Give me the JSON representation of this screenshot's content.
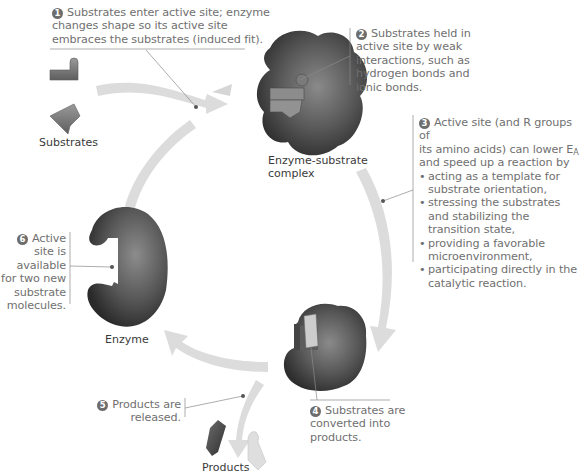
{
  "labels": {
    "substrates": "Substrates",
    "enzyme_substrate_complex_line1": "Enzyme-substrate",
    "enzyme_substrate_complex_line2": "complex",
    "enzyme": "Enzyme",
    "products": "Products"
  },
  "steps": [
    {
      "number": "1",
      "lines": [
        "Substrates enter active site; enzyme",
        "changes shape so its active site",
        "embraces the substrates (induced fit)."
      ]
    },
    {
      "number": "2",
      "lines": [
        "Substrates held in",
        "active site by weak",
        "interactions, such as",
        "hydrogen bonds and",
        "ionic bonds."
      ]
    },
    {
      "number": "3",
      "intro_lines": [
        "Active site (and R groups of",
        "its amino acids) can lower E",
        "and speed up a reaction by"
      ],
      "subscript": "A",
      "bullets": [
        [
          "acting as a template for",
          "substrate orientation,"
        ],
        [
          "stressing the substrates",
          "and stabilizing the",
          "transition state,"
        ],
        [
          "providing a favorable",
          "microenvironment,"
        ],
        [
          "participating directly in the",
          "catalytic reaction."
        ]
      ]
    },
    {
      "number": "4",
      "lines": [
        "Substrates are",
        "converted into",
        "products."
      ]
    },
    {
      "number": "5",
      "lines": [
        "Products are",
        "released."
      ]
    },
    {
      "number": "6",
      "lines": [
        "Active",
        "site is",
        "available",
        "for two new",
        "substrate",
        "molecules."
      ]
    }
  ],
  "colors": {
    "arrow": "#dcdcdc",
    "enzyme_dark": "#3c3c3c",
    "enzyme_mid": "#6a6a6a",
    "substrate": "#7a7a7a",
    "text": "#707070",
    "leader_line": "#8a8a8a"
  }
}
